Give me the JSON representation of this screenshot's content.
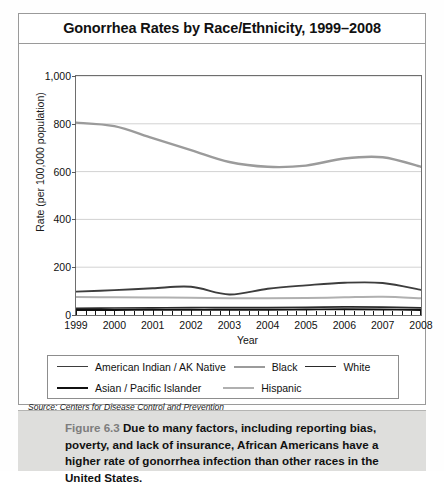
{
  "figure": {
    "title": "Gonorrhea Rates by Race/Ethnicity, 1999–2008",
    "source": "Source: Centers for Disease Control and Prevention",
    "copyright": "© Infobase Publishing",
    "caption_number": "Figure 6.3",
    "caption_text": "Due to many factors, including reporting bias, poverty, and lack of insurance, African Americans have a higher rate of gonorrhea infection than other races in the United States."
  },
  "chart_data": {
    "type": "line",
    "title": "Gonorrhea Rates by Race/Ethnicity, 1999–2008",
    "xlabel": "Year",
    "ylabel": "Rate (per 100,000 population)",
    "x": [
      1999,
      2000,
      2001,
      2002,
      2003,
      2004,
      2005,
      2006,
      2007,
      2008
    ],
    "xtick_labels": [
      "1999",
      "2000",
      "2001",
      "2002",
      "2003",
      "2004",
      "2005",
      "2006",
      "2007",
      "2008"
    ],
    "ytick_labels": [
      "0",
      "200",
      "400",
      "600",
      "800",
      "1,000"
    ],
    "yticks": [
      0,
      200,
      400,
      600,
      800,
      1000
    ],
    "ylim": [
      0,
      1000
    ],
    "xlim": [
      1999,
      2008
    ],
    "grid": "horizontal",
    "legend_position": "below-plot",
    "series": [
      {
        "name": "American Indian / AK Native",
        "color": "#3d3d3d",
        "width": 1.9,
        "values": [
          98,
          104,
          112,
          118,
          86,
          110,
          124,
          135,
          134,
          105
        ]
      },
      {
        "name": "Black",
        "color": "#9b9b9b",
        "width": 2.4,
        "values": [
          805,
          790,
          740,
          690,
          640,
          620,
          625,
          655,
          660,
          620
        ]
      },
      {
        "name": "White",
        "color": "#2a2a2a",
        "width": 1.6,
        "values": [
          28,
          29,
          30,
          31,
          31,
          31,
          32,
          34,
          33,
          30
        ]
      },
      {
        "name": "Asian / Pacific Islander",
        "color": "#111111",
        "width": 1.9,
        "values": [
          21,
          21,
          22,
          22,
          22,
          22,
          23,
          24,
          23,
          21
        ]
      },
      {
        "name": "Hispanic",
        "color": "#b0b0b0",
        "width": 2.0,
        "values": [
          75,
          74,
          73,
          72,
          70,
          70,
          71,
          74,
          76,
          70
        ]
      }
    ]
  },
  "legend": {
    "row1": [
      {
        "label": "American Indian / AK Native",
        "color": "#3d3d3d",
        "width": 1.9
      },
      {
        "label": "Black",
        "color": "#9b9b9b",
        "width": 2.2
      },
      {
        "label": "White",
        "color": "#2a2a2a",
        "width": 1.9
      }
    ],
    "row2": [
      {
        "label": "Asian / Pacific Islander",
        "color": "#111111",
        "width": 2.2
      },
      {
        "label": "Hispanic",
        "color": "#b0b0b0",
        "width": 2.0
      }
    ]
  }
}
